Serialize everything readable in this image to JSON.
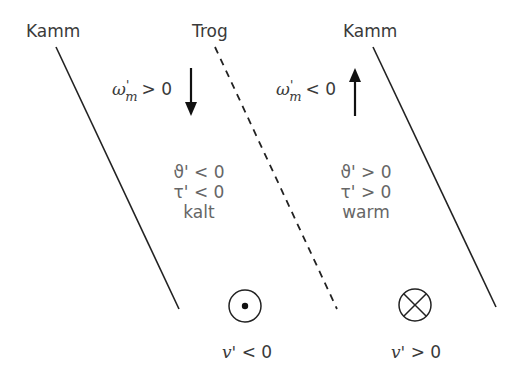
{
  "labels": {
    "ridge_left": "Kamm",
    "trough": "Trog",
    "ridge_right": "Kamm"
  },
  "omega_left": {
    "symbol": "ω",
    "prime": "'",
    "sub": "m",
    "relation": "> 0"
  },
  "omega_right": {
    "symbol": "ω",
    "prime": "'",
    "sub": "m",
    "relation": "< 0"
  },
  "cold_region": {
    "theta": "ϑ' < 0",
    "tau": "τ' < 0",
    "label": "kalt"
  },
  "warm_region": {
    "theta": "ϑ' > 0",
    "tau": "τ' > 0",
    "label": "warm"
  },
  "v_left": {
    "symbol": "v'",
    "relation": " < 0",
    "icon": "out-of-page-dot-circle"
  },
  "v_right": {
    "symbol": "v'",
    "relation": " > 0",
    "icon": "into-page-cross-circle"
  },
  "colors": {
    "line": "#222222",
    "text": "#3a3a3a",
    "region_text": "#666666"
  }
}
